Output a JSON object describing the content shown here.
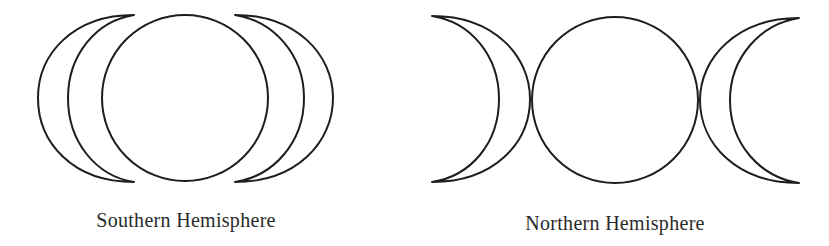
{
  "figure": {
    "panels": [
      {
        "id": "southern",
        "label": "Southern Hemisphere",
        "arrangement": "crescents facing outward (waning-full-waxing reversed)"
      },
      {
        "id": "northern",
        "label": "Northern Hemisphere",
        "arrangement": "crescents facing inward (triple moon)"
      }
    ],
    "colors": {
      "stroke": "#1e1e1e",
      "text": "#2a2a2a",
      "background": "#ffffff"
    }
  }
}
